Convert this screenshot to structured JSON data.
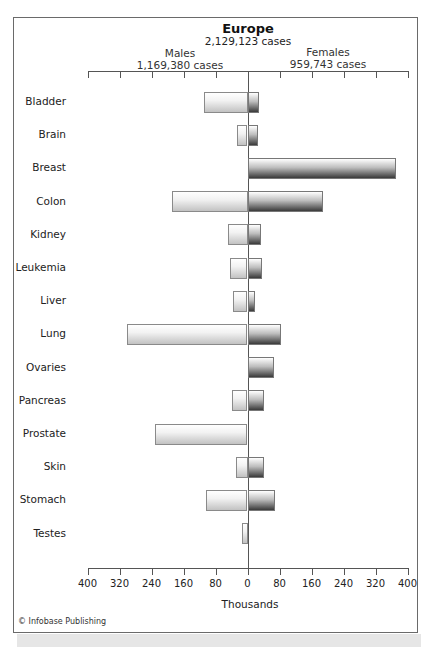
{
  "chart_data": {
    "type": "bar",
    "orientation": "horizontal",
    "layout": "population-pyramid (butterfly)",
    "title": "Europe",
    "subtitle": "2,129,123 cases",
    "xlabel": "Thousands",
    "ylabel": "",
    "xlim": [
      -400,
      400
    ],
    "x_ticks": [
      400,
      320,
      240,
      160,
      80,
      0,
      80,
      160,
      240,
      320,
      400
    ],
    "grid": false,
    "categories": [
      "Bladder",
      "Brain",
      "Breast",
      "Colon",
      "Kidney",
      "Leukemia",
      "Liver",
      "Lung",
      "Ovaries",
      "Pancreas",
      "Prostate",
      "Skin",
      "Stomach",
      "Testes"
    ],
    "series": [
      {
        "name": "Males",
        "total_label": "1,169,380 cases",
        "side": "left",
        "values": [
          110,
          27,
          0,
          190,
          50,
          43,
          37,
          302,
          0,
          38,
          232,
          30,
          104,
          15
        ]
      },
      {
        "name": "Females",
        "total_label": "959,743 cases",
        "side": "right",
        "values": [
          28,
          25,
          372,
          188,
          33,
          35,
          18,
          83,
          66,
          41,
          0,
          40,
          69,
          0
        ]
      }
    ]
  },
  "header": {
    "title": "Europe",
    "subtitle": "2,129,123 cases",
    "males_label": "Males",
    "males_total": "1,169,380 cases",
    "females_label": "Females",
    "females_total": "959,743 cases"
  },
  "axis": {
    "ticks": [
      "400",
      "320",
      "240",
      "160",
      "80",
      "0",
      "80",
      "160",
      "240",
      "320",
      "400"
    ],
    "label": "Thousands"
  },
  "credit": "© Infobase Publishing",
  "colors": {
    "frame": "#6a6a6a",
    "male_bar_top": "#ffffff",
    "male_bar_bottom": "#c2c2c2",
    "female_bar_top": "#ffffff",
    "female_bar_bottom": "#3a3a3a",
    "strip": "#e6e6e6"
  }
}
